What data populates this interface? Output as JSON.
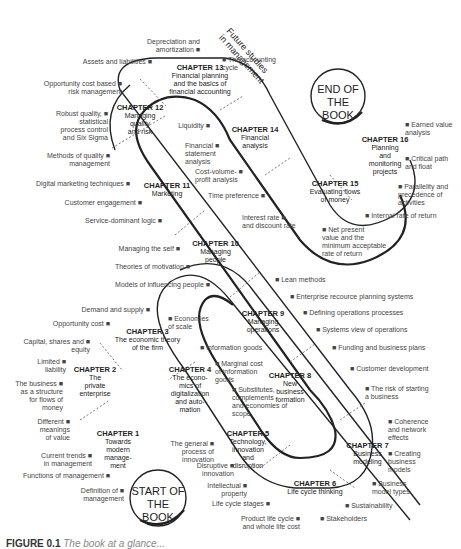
{
  "diagram": {
    "start_circle": "START OF\nTHE BOOK",
    "end_circle": "END OF\nTHE BOOK",
    "future": "Future studies\nin management",
    "chapters": [
      {
        "num": "CHAPTER 1",
        "title": "Towards\nmodern\nmanage-\nment"
      },
      {
        "num": "CHAPTER 2",
        "title": "The\nprivate\nenterprise"
      },
      {
        "num": "CHAPTER 3",
        "title": "The economic theory\nof the firm"
      },
      {
        "num": "CHAPTER 4",
        "title": "The econo-\nmics of\ndigitalization\nand auto-\nmation"
      },
      {
        "num": "CHAPTER 5",
        "title": "Technology,\ninnovation\nand\ndisruption"
      },
      {
        "num": "CHAPTER 6",
        "title": "Life cycle thinking"
      },
      {
        "num": "CHAPTER 7",
        "title": "Business\nmodeling"
      },
      {
        "num": "CHAPTER 8",
        "title": "New\nbusiness\nformation"
      },
      {
        "num": "CHAPTER 9",
        "title": "Managing\noperations"
      },
      {
        "num": "CHAPTER 10",
        "title": "Managing\npeople"
      },
      {
        "num": "CHAPTER 11",
        "title": "Marketing"
      },
      {
        "num": "CHAPTER 12",
        "title": "Managing\nquality\nand risk"
      },
      {
        "num": "CHAPTER 13",
        "title": "Financial planning\nand the basics of\nfinancial accounting"
      },
      {
        "num": "CHAPTER 14",
        "title": "Financial\nanalysis"
      },
      {
        "num": "CHAPTER 15",
        "title": "Evaluating flows\nof money"
      },
      {
        "num": "CHAPTER 16",
        "title": "Planning\nand\nmonitoring\nprojects"
      }
    ],
    "topics": [
      "Depreciation and\namortization ■",
      "Assets and liabilities ■",
      "■ The accounting\ncycle",
      "Opportunity cost based ■\nrisk management",
      "Robust quality, ■\nstatistical\nprocess control\nand Six Sigma",
      "Methods of quality ■\nmanagement",
      "Liquidity ■",
      "Financial ■\nstatement\nanalysis",
      "Cost-volume- ■\nprofit analysis",
      "Time preference ■",
      "Digital marketing techniques ■",
      "Customer engagement ■",
      "Service-dominant logic ■",
      "Interest rate ■\nand discount rate",
      "■ Net present\nvalue and the\nminimum acceptable\nrate of return",
      "■ Internal rate of return",
      "■ Parallelity and\nprecedence of\nactivities",
      "■ Critical path\nand float",
      "■ Earned value\nanalysis",
      "Managing the self ■",
      "Theories of motivation ■",
      "Models of influencing people ■",
      "■ Lean methods",
      "■ Enterprise recource planning systems",
      "■ Defining operations processes",
      "■ Systems view of operations",
      "■ Funding and business plans",
      "■ Customer development",
      "■ The risk of starting\na business",
      "Demand and supply ■",
      "Opportunity cost ■",
      "■ Economies\nof scale",
      "Capital, shares and ■\nequity",
      "Limited ■\nliability",
      "The business ■\nas a structure\nfor flows of\nmoney",
      "Different ■\nmeanings\nof value",
      "■ Information goods",
      "■ Marginal cost\nof information\ngoods",
      "■ Substitutes,\ncomplements\nand economies of\nscope",
      "Current trends ■\nin management",
      "Functions of management ■",
      "Definition of ■\nmanagement",
      "The general ■\nprocess of\ninnovation",
      "Disruptive ■\ninnovation",
      "Intellectual ■\nproperty",
      "Life cycle stages ■",
      "Product life cycle ■\nand whole life cost",
      "■ Stakeholders",
      "■ Sustainability",
      "■ Business\nmodel types",
      "■ Creating\nbusiness\nmodels",
      "■ Coherence\nand network\neffects"
    ]
  },
  "caption": {
    "label": "FIGURE 0.1",
    "text": "The book at a glance..."
  }
}
